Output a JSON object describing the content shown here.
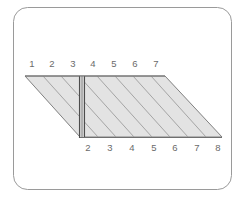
{
  "figure": {
    "background_color": "#ffffff",
    "frame": {
      "name": "rounded-rectangle-frame",
      "stroke_color": "#9a9a9a",
      "fill_color": "#ffffff",
      "corner_radius": 14,
      "x": 13,
      "y": 7,
      "width": 219,
      "height": 183
    },
    "shape": {
      "name": "hatched-parallelogram",
      "fill_color": "#e3e3e3",
      "stroke_color": "#808080",
      "hatch_color": "#9d9d9d",
      "top_left_x": 25,
      "top_right_x": 165,
      "bottom_left_x": 80,
      "bottom_right_x": 222,
      "top_y": 76,
      "bottom_y": 137
    },
    "divider": {
      "name": "vertical-divider-bar",
      "stroke_color": "#4d4d4d",
      "fill_color": "#d2d2d2",
      "x_left": 79,
      "x_right": 85,
      "y_top": 76,
      "y_bottom": 138
    },
    "hatch_lines": {
      "name": "diagonal-hatch-lines",
      "count": 8,
      "color": "#9d9d9d",
      "width": 0.9
    }
  },
  "labels": {
    "top_axis": {
      "name": "top-tick-labels",
      "color": "#6a6a6a",
      "y": 67,
      "values": [
        "1",
        "2",
        "3",
        "4",
        "5",
        "6",
        "7"
      ],
      "x_positions": [
        32,
        52,
        73,
        93,
        114,
        135,
        156
      ]
    },
    "bottom_axis": {
      "name": "bottom-tick-labels",
      "color": "#6a6a6a",
      "y": 151,
      "values": [
        "2",
        "3",
        "4",
        "5",
        "6",
        "7",
        "8"
      ],
      "x_positions": [
        88,
        110,
        132,
        154,
        175,
        197,
        218
      ]
    }
  }
}
